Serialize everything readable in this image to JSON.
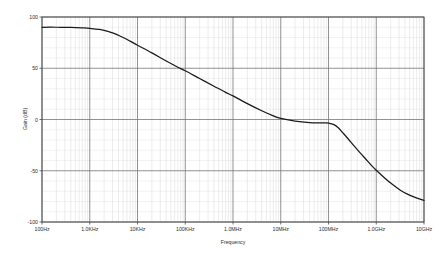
{
  "chart_data": {
    "type": "line",
    "title": "",
    "xlabel": "Frequency",
    "ylabel": "Gain (dB)",
    "xscale": "log",
    "yscale": "linear",
    "xlim": [
      100,
      10000000000
    ],
    "ylim": [
      -100,
      100
    ],
    "grid": true,
    "legend": "none",
    "x_tick_labels": [
      "100Hz",
      "1.0KHz",
      "10KHz",
      "100KHz",
      "1.0MHz",
      "10MHz",
      "100MHz",
      "1.0GHz",
      "10GHz"
    ],
    "x_tick_values": [
      100,
      1000,
      10000,
      100000,
      1000000,
      10000000,
      100000000,
      1000000000,
      10000000000
    ],
    "y_tick_labels": [
      "100",
      "50",
      "0",
      "-50",
      "-100"
    ],
    "y_tick_values": [
      100,
      50,
      0,
      -50,
      -100
    ],
    "series": [
      {
        "name": "Gain",
        "color": "#1a1a1a",
        "x": [
          100,
          200,
          400,
          700,
          1000,
          1500,
          2000,
          3000,
          5000,
          7000,
          10000,
          20000,
          40000,
          70000,
          100000,
          200000,
          400000,
          700000,
          1000000,
          2000000,
          4000000,
          7000000,
          10000000,
          20000000,
          40000000,
          60000000,
          80000000,
          100000000,
          130000000,
          160000000,
          200000000,
          260000000,
          340000000,
          450000000,
          600000000,
          800000000,
          1000000000,
          1500000000,
          2200000000,
          3200000000,
          4600000000,
          6500000000,
          10000000000
        ],
        "y": [
          90,
          90,
          89.8,
          89.4,
          89,
          88,
          87,
          84.5,
          80,
          76.5,
          72.5,
          65,
          57,
          51,
          47.5,
          40,
          32.5,
          26.5,
          23,
          15.5,
          8.5,
          3.5,
          1,
          -1.5,
          -3,
          -3.3,
          -3.4,
          -3.5,
          -5,
          -8,
          -13,
          -19,
          -25.5,
          -32,
          -38.5,
          -45,
          -49.5,
          -57,
          -63.5,
          -69,
          -73,
          -76,
          -79
        ]
      }
    ],
    "annotations": []
  },
  "plot_geometry": {
    "left": 42,
    "right": 424,
    "top": 17,
    "bottom": 222
  }
}
